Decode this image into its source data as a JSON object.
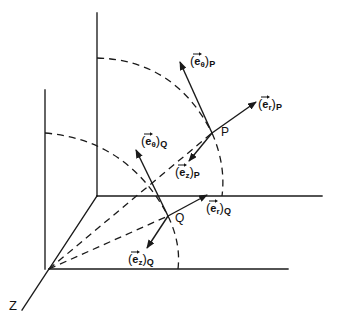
{
  "figure": {
    "type": "3d-cylindrical-coordinate-diagram",
    "background_color": "#ffffff",
    "line_color": "#1a1a1a",
    "axis_label_z": "Z",
    "points": [
      {
        "id": "P",
        "label": "P",
        "x": 212,
        "y": 133
      },
      {
        "id": "Q",
        "label": "Q",
        "x": 168,
        "y": 216
      }
    ],
    "vectors": [
      {
        "id": "e-theta-P",
        "open_paren": "(",
        "base": "e",
        "sub": "θ",
        "close_paren": ")",
        "point_sub": "P",
        "from_x": 212,
        "from_y": 133,
        "to_x": 180,
        "to_y": 62
      },
      {
        "id": "e-r-P",
        "open_paren": "(",
        "base": "e",
        "sub": "r",
        "close_paren": ")",
        "point_sub": "P",
        "from_x": 212,
        "from_y": 133,
        "to_x": 256,
        "to_y": 102
      },
      {
        "id": "e-z-P",
        "open_paren": "(",
        "base": "e",
        "sub": "z",
        "close_paren": ")",
        "point_sub": "P",
        "from_x": 212,
        "from_y": 133,
        "to_x": 189,
        "to_y": 161
      },
      {
        "id": "e-theta-Q",
        "open_paren": "(",
        "base": "e",
        "sub": "θ",
        "close_paren": ")",
        "point_sub": "Q",
        "from_x": 168,
        "from_y": 216,
        "to_x": 136,
        "to_y": 150
      },
      {
        "id": "e-r-Q",
        "open_paren": "(",
        "base": "e",
        "sub": "r",
        "close_paren": ")",
        "point_sub": "Q",
        "from_x": 168,
        "from_y": 216,
        "to_x": 207,
        "to_y": 195
      },
      {
        "id": "e-z-Q",
        "open_paren": "(",
        "base": "e",
        "sub": "z",
        "close_paren": ")",
        "point_sub": "Q",
        "from_x": 168,
        "from_y": 216,
        "to_x": 147,
        "to_y": 248
      }
    ],
    "label_positions": {
      "e_theta_P": {
        "left": 190,
        "top": 54
      },
      "e_r_P": {
        "left": 258,
        "top": 97
      },
      "e_z_P": {
        "left": 175,
        "top": 165
      },
      "e_theta_Q": {
        "left": 141,
        "top": 134
      },
      "e_r_Q": {
        "left": 206,
        "top": 201
      },
      "e_z_Q": {
        "left": 128,
        "top": 252
      },
      "point_P": {
        "left": 221,
        "top": 126
      },
      "point_Q": {
        "left": 175,
        "top": 212
      },
      "axis_Z": {
        "left": 9,
        "top": 299
      }
    }
  }
}
